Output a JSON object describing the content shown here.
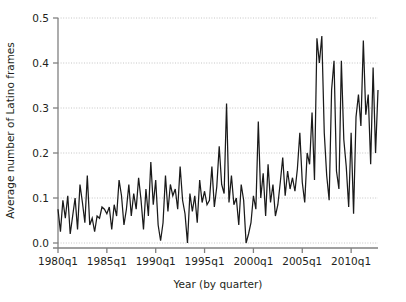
{
  "chart_data": {
    "type": "line",
    "title": "",
    "xlabel": "Year (by quarter)",
    "ylabel": "Average number of Latino frames",
    "xlim": [
      1980.0,
      2012.75
    ],
    "ylim": [
      0.0,
      0.5
    ],
    "grid": true,
    "legend": "none",
    "line_color": "#1a1a1a",
    "grid_color": "#b8b8b8",
    "axis_color": "#808080",
    "background": "#ffffff",
    "xticks": [
      1980,
      1985,
      1990,
      1995,
      2000,
      2005,
      2010
    ],
    "xtick_labels": [
      "1980q1",
      "1985q1",
      "1990q1",
      "1995q1",
      "2000q1",
      "2005q1",
      "2010q1"
    ],
    "yticks": [
      0.0,
      0.1,
      0.2,
      0.3,
      0.4,
      0.5
    ],
    "ytick_labels": [
      "0.0",
      "0.1",
      "0.2",
      "0.3",
      "0.4",
      "0.5"
    ],
    "x": [
      1980.0,
      1980.25,
      1980.5,
      1980.75,
      1981.0,
      1981.25,
      1981.5,
      1981.75,
      1982.0,
      1982.25,
      1982.5,
      1982.75,
      1983.0,
      1983.25,
      1983.5,
      1983.75,
      1984.0,
      1984.25,
      1984.5,
      1984.75,
      1985.0,
      1985.25,
      1985.5,
      1985.75,
      1986.0,
      1986.25,
      1986.5,
      1986.75,
      1987.0,
      1987.25,
      1987.5,
      1987.75,
      1988.0,
      1988.25,
      1988.5,
      1988.75,
      1989.0,
      1989.25,
      1989.5,
      1989.75,
      1990.0,
      1990.25,
      1990.5,
      1990.75,
      1991.0,
      1991.25,
      1991.5,
      1991.75,
      1992.0,
      1992.25,
      1992.5,
      1992.75,
      1993.0,
      1993.25,
      1993.5,
      1993.75,
      1994.0,
      1994.25,
      1994.5,
      1994.75,
      1995.0,
      1995.25,
      1995.5,
      1995.75,
      1996.0,
      1996.25,
      1996.5,
      1996.75,
      1997.0,
      1997.25,
      1997.5,
      1997.75,
      1998.0,
      1998.25,
      1998.5,
      1998.75,
      1999.0,
      1999.25,
      1999.5,
      1999.75,
      2000.0,
      2000.25,
      2000.5,
      2000.75,
      2001.0,
      2001.25,
      2001.5,
      2001.75,
      2002.0,
      2002.25,
      2002.5,
      2002.75,
      2003.0,
      2003.25,
      2003.5,
      2003.75,
      2004.0,
      2004.25,
      2004.5,
      2004.75,
      2005.0,
      2005.25,
      2005.5,
      2005.75,
      2006.0,
      2006.25,
      2006.5,
      2006.75,
      2007.0,
      2007.25,
      2007.5,
      2007.75,
      2008.0,
      2008.25,
      2008.5,
      2008.75,
      2009.0,
      2009.25,
      2009.5,
      2009.75,
      2010.0,
      2010.25,
      2010.5,
      2010.75,
      2011.0,
      2011.25,
      2011.5,
      2011.75,
      2012.0,
      2012.25,
      2012.5,
      2012.75
    ],
    "values": [
      0.075,
      0.025,
      0.095,
      0.055,
      0.105,
      0.02,
      0.06,
      0.1,
      0.03,
      0.13,
      0.09,
      0.045,
      0.15,
      0.04,
      0.055,
      0.025,
      0.06,
      0.055,
      0.08,
      0.075,
      0.065,
      0.08,
      0.03,
      0.085,
      0.06,
      0.14,
      0.105,
      0.04,
      0.075,
      0.13,
      0.06,
      0.11,
      0.075,
      0.145,
      0.095,
      0.03,
      0.12,
      0.06,
      0.18,
      0.085,
      0.14,
      0.04,
      0.005,
      0.045,
      0.15,
      0.07,
      0.13,
      0.105,
      0.12,
      0.075,
      0.17,
      0.095,
      0.065,
      0.0,
      0.11,
      0.07,
      0.105,
      0.045,
      0.14,
      0.09,
      0.115,
      0.085,
      0.095,
      0.17,
      0.08,
      0.125,
      0.215,
      0.13,
      0.11,
      0.31,
      0.09,
      0.15,
      0.085,
      0.1,
      0.04,
      0.13,
      0.095,
      0.0,
      0.02,
      0.045,
      0.105,
      0.075,
      0.27,
      0.1,
      0.155,
      0.06,
      0.175,
      0.09,
      0.13,
      0.06,
      0.085,
      0.135,
      0.19,
      0.105,
      0.16,
      0.12,
      0.145,
      0.115,
      0.165,
      0.245,
      0.135,
      0.09,
      0.2,
      0.175,
      0.29,
      0.14,
      0.455,
      0.4,
      0.46,
      0.245,
      0.15,
      0.095,
      0.34,
      0.405,
      0.16,
      0.12,
      0.405,
      0.23,
      0.17,
      0.08,
      0.245,
      0.065,
      0.28,
      0.33,
      0.26,
      0.45,
      0.285,
      0.33,
      0.175,
      0.39,
      0.2,
      0.34
    ]
  }
}
